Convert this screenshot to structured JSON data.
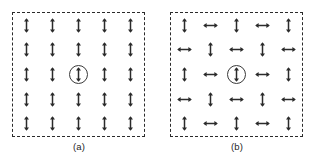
{
  "figure": {
    "background_color": "#ffffff",
    "ink_color": "#2b2b2b",
    "panels": [
      {
        "id": "panel-a",
        "caption": "(a)",
        "border_style": "dashed",
        "grid_rows": 5,
        "grid_cols": 5,
        "center_marked": true,
        "center_marker": "circle",
        "center_arrow": "up",
        "description": "All dipoles aligned vertically (parallel ordering)",
        "cells": [
          [
            "up",
            "up",
            "up",
            "up",
            "up"
          ],
          [
            "up",
            "up",
            "up",
            "up",
            "up"
          ],
          [
            "up",
            "up",
            "up-circled",
            "up",
            "up"
          ],
          [
            "up",
            "up",
            "up",
            "up",
            "up"
          ],
          [
            "up",
            "up",
            "up",
            "up",
            "up"
          ]
        ]
      },
      {
        "id": "panel-b",
        "caption": "(b)",
        "border_style": "dashed",
        "grid_rows": 5,
        "grid_cols": 5,
        "center_marked": true,
        "center_marker": "circle",
        "center_arrow": "up",
        "description": "Dipoles alternate vertical and horizontal in checkerboard ordering",
        "cells": [
          [
            "up",
            "right",
            "up",
            "right",
            "up"
          ],
          [
            "right",
            "up",
            "right",
            "up",
            "right"
          ],
          [
            "up",
            "right",
            "up-circled",
            "right",
            "up"
          ],
          [
            "right",
            "up",
            "right",
            "up",
            "right"
          ],
          [
            "up",
            "right",
            "up",
            "right",
            "up"
          ]
        ]
      }
    ],
    "legend": {
      "up_symbol_name": "vertical-double-arrow",
      "right_symbol_name": "horizontal-double-arrow",
      "circle_symbol_name": "reference-site-circle"
    }
  }
}
